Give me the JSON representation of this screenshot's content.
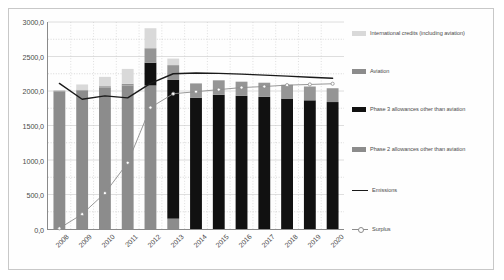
{
  "chart_data": {
    "type": "bar",
    "title": "",
    "xlabel": "",
    "ylabel": "",
    "ylim": [
      0,
      3000
    ],
    "ytick_values": [
      0,
      500,
      1000,
      1500,
      2000,
      2500,
      3000
    ],
    "ytick_labels": [
      "0,0",
      "500,0",
      "1000,0",
      "1500,0",
      "2000,0",
      "2500,0",
      "3000,0"
    ],
    "grid": true,
    "legend_position": "right",
    "stacked": true,
    "categories": [
      "2008",
      "2009",
      "2010",
      "2011",
      "2012",
      "2013",
      "2014",
      "2015",
      "2016",
      "2017",
      "2018",
      "2019",
      "2020"
    ],
    "series": [
      {
        "name": "Phase 2 allowances other than aviation",
        "type": "bar",
        "color": "#8c8c8c",
        "values": [
          1990,
          2005,
          2050,
          2080,
          2080,
          150,
          0,
          0,
          0,
          0,
          0,
          0,
          0
        ]
      },
      {
        "name": "Phase 3 allowances other than aviation",
        "type": "bar",
        "color": "#111111",
        "values": [
          0,
          0,
          0,
          0,
          330,
          2010,
          1900,
          1945,
          1930,
          1915,
          1890,
          1865,
          1840
        ]
      },
      {
        "name": "Aviation",
        "type": "bar",
        "color": "#959595",
        "values": [
          15,
          15,
          20,
          25,
          210,
          215,
          210,
          210,
          205,
          205,
          200,
          200,
          200
        ]
      },
      {
        "name": "International credits (including aviation)",
        "type": "bar",
        "color": "#d9d9d9",
        "values": [
          0,
          75,
          135,
          215,
          290,
          95,
          0,
          0,
          0,
          0,
          0,
          0,
          0
        ]
      },
      {
        "name": "Emissions",
        "type": "line",
        "color": "#1a1a1a",
        "values": [
          2110,
          1880,
          1930,
          1900,
          2110,
          2250,
          2260,
          2255,
          2245,
          2230,
          2215,
          2200,
          2185
        ]
      },
      {
        "name": "Surplus",
        "type": "line",
        "color": "#8c8c8c",
        "marker": "circle",
        "values": [
          10,
          215,
          520,
          960,
          1760,
          1960,
          1990,
          2020,
          2050,
          2065,
          2085,
          2095,
          2105
        ]
      }
    ]
  },
  "legend": {
    "items": [
      {
        "label": "International credits (including aviation)",
        "kind": "swatch",
        "color": "#d9d9d9"
      },
      {
        "label": "Aviation",
        "kind": "swatch",
        "color": "#8c8c8c"
      },
      {
        "label": "Phase 3 allowances other than aviation",
        "kind": "swatch",
        "color": "#111111"
      },
      {
        "label": "Phase 2 allowances other than aviation",
        "kind": "swatch",
        "color": "#8c8c8c"
      },
      {
        "label": "Emissions",
        "kind": "line",
        "color": "#1a1a1a"
      },
      {
        "label": "Surplus",
        "kind": "line-marker",
        "color": "#8c8c8c"
      }
    ]
  }
}
